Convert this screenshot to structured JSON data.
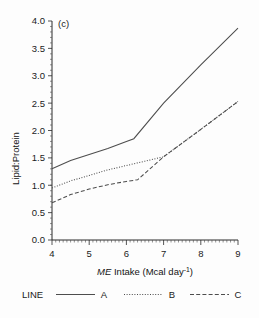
{
  "figure": {
    "panel_label": "(c)",
    "background_color": "#fdfdfd",
    "line_color": "#4d4d4d",
    "text_color": "#1b1b1b"
  },
  "axes": {
    "x_title_italic": "ME",
    "x_title_rest": " Intake  (Mcal day",
    "x_title_sup": "-1",
    "x_title_close": ")",
    "x_title_full": "ME Intake (Mcal day-1)",
    "y_title": "Lipid:Protein",
    "x_ticks": [
      "4",
      "5",
      "6",
      "7",
      "8",
      "9"
    ],
    "y_ticks": [
      "0.0",
      "0.5",
      "1.0",
      "1.5",
      "2.0",
      "2.5",
      "3.0",
      "3.5",
      "4.0"
    ]
  },
  "legend": {
    "title": "LINE",
    "entries": [
      {
        "label": "A",
        "style": "solid"
      },
      {
        "label": "B",
        "style": "dotted"
      },
      {
        "label": "C",
        "style": "dashed"
      }
    ]
  },
  "chart_data": {
    "type": "line",
    "title": "(c)",
    "xlabel": "ME Intake (Mcal day-1)",
    "ylabel": "Lipid:Protein",
    "xlim": [
      4,
      9
    ],
    "ylim": [
      0.0,
      4.0
    ],
    "xticks": [
      4,
      5,
      6,
      7,
      8,
      9
    ],
    "yticks": [
      0.0,
      0.5,
      1.0,
      1.5,
      2.0,
      2.5,
      3.0,
      3.5,
      4.0
    ],
    "grid": false,
    "legend_position": "below-plot",
    "legend_title": "LINE",
    "series": [
      {
        "name": "A",
        "style": "solid",
        "x": [
          4.0,
          4.5,
          5.0,
          5.5,
          6.0,
          6.2,
          7.0,
          8.0,
          9.0
        ],
        "y": [
          1.3,
          1.45,
          1.56,
          1.67,
          1.8,
          1.85,
          2.5,
          3.2,
          3.87
        ]
      },
      {
        "name": "B",
        "style": "dotted",
        "x": [
          4.0,
          4.5,
          5.0,
          5.5,
          6.0,
          6.5,
          7.0,
          8.0,
          9.0
        ],
        "y": [
          0.95,
          1.08,
          1.18,
          1.28,
          1.36,
          1.44,
          1.52,
          2.02,
          2.53
        ]
      },
      {
        "name": "C",
        "style": "dashed",
        "x": [
          4.0,
          4.5,
          5.0,
          5.5,
          6.0,
          6.3,
          7.0,
          8.0,
          9.0
        ],
        "y": [
          0.68,
          0.83,
          0.93,
          1.01,
          1.07,
          1.1,
          1.52,
          2.02,
          2.53
        ]
      }
    ]
  }
}
